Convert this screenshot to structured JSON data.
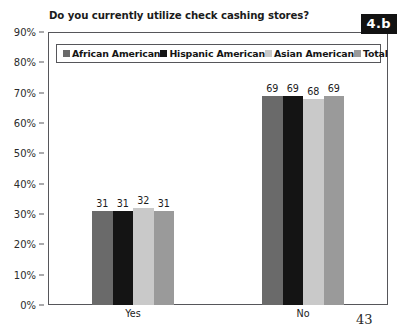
{
  "figure": {
    "badge_label": "4.b",
    "page_number": "43"
  },
  "legend": {
    "items": [
      {
        "label": "African American",
        "color": "#6a6a6a"
      },
      {
        "label": "Hispanic American",
        "color": "#141414"
      },
      {
        "label": "Asian American",
        "color": "#c9c9c9"
      },
      {
        "label": "Total",
        "color": "#9a9a9a"
      }
    ]
  },
  "chart_data": {
    "type": "bar",
    "title": "Do you currently utilize check cashing stores?",
    "xlabel": "",
    "ylabel": "",
    "categories": [
      "Yes",
      "No"
    ],
    "series": [
      {
        "name": "African American",
        "color": "#6a6a6a",
        "values": [
          31,
          69
        ]
      },
      {
        "name": "Hispanic American",
        "color": "#141414",
        "values": [
          31,
          69
        ]
      },
      {
        "name": "Asian American",
        "color": "#c9c9c9",
        "values": [
          32,
          68
        ]
      },
      {
        "name": "Total",
        "color": "#9a9a9a",
        "values": [
          31,
          69
        ]
      }
    ],
    "ylim": [
      0,
      90
    ],
    "ytick_values": [
      0,
      10,
      20,
      30,
      40,
      50,
      60,
      70,
      80,
      90
    ],
    "ytick_labels": [
      "0%",
      "10%",
      "20%",
      "30%",
      "40%",
      "50%",
      "60%",
      "70%",
      "80%",
      "90%"
    ],
    "grid": false,
    "value_labels": true,
    "legend_position": "top-inside"
  }
}
